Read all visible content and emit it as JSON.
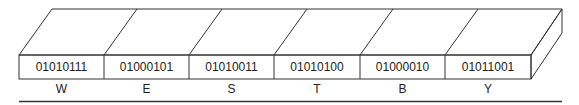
{
  "diagram": {
    "title": "",
    "cells": [
      {
        "bits": "01010111",
        "char": "W"
      },
      {
        "bits": "01000101",
        "char": "E"
      },
      {
        "bits": "01010011",
        "char": "S"
      },
      {
        "bits": "01010100",
        "char": "T"
      },
      {
        "bits": "01000010",
        "char": "B"
      },
      {
        "bits": "01011001",
        "char": "Y"
      }
    ],
    "colors": {
      "stroke": "#333333",
      "background": "#ffffff",
      "text": "#222222"
    }
  }
}
